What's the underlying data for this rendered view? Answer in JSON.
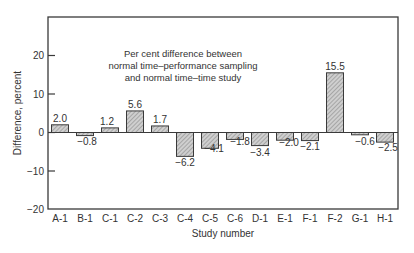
{
  "chart_data": {
    "type": "bar",
    "title_lines": [
      "Per cent difference between",
      "normal time–performance sampling",
      "and normal time–time study"
    ],
    "xlabel": "Study number",
    "ylabel": "Difference, percent",
    "ylim": [
      -20,
      30
    ],
    "yticks": [
      20,
      10,
      0,
      -10,
      -20
    ],
    "ytick_labels": [
      "20",
      "10",
      "0",
      "−10",
      "−20"
    ],
    "grid": false,
    "legend": null,
    "categories": [
      "A-1",
      "B-1",
      "C-1",
      "C-2",
      "C-3",
      "C-4",
      "C-5",
      "C-6",
      "D-1",
      "E-1",
      "F-1",
      "F-2",
      "G-1",
      "H-1"
    ],
    "values": [
      2.0,
      -0.8,
      1.2,
      5.6,
      1.7,
      -6.2,
      -4.1,
      -1.8,
      -3.4,
      -2.0,
      -2.1,
      15.5,
      -0.6,
      -2.5
    ],
    "value_labels": [
      "2.0",
      "−0.8",
      "1.2",
      "5.6",
      "1.7",
      "−6.2",
      "−4.1",
      "−1.8",
      "−3.4",
      "−2.0",
      "−2.1",
      "15.5",
      "−0.6",
      "−2.5"
    ],
    "bar_fill": "hatched gray",
    "colors": {
      "bar": "#b8b8b8",
      "bar_stroke": "#3a3a3a",
      "axis": "#3a3a3a"
    }
  }
}
